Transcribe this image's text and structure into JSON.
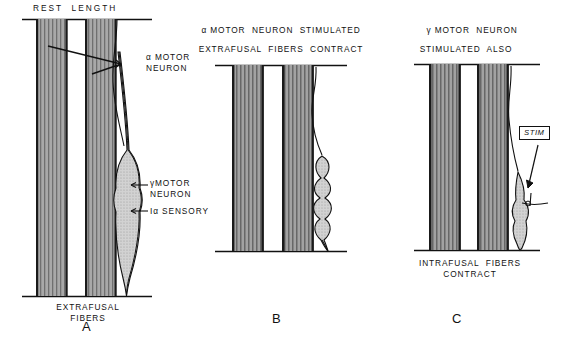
{
  "figure": {
    "type": "anatomical-diagram",
    "panels": [
      {
        "id": "A",
        "letter": "A",
        "header_lines": [
          "REST  LENGTH"
        ],
        "footer_lines": [
          "EXTRAFUSAL",
          "FIBERS"
        ],
        "annotations": [
          {
            "name": "alpha-motor-neuron",
            "text": "α MOTOR\nNEURON"
          },
          {
            "name": "gamma-motor-neuron",
            "text": "γMOTOR\nNEURON"
          },
          {
            "name": "ia-sensory",
            "text": "Iα SENSORY"
          }
        ],
        "state": "spindle at rest length, intrafusal fibers taut"
      },
      {
        "id": "B",
        "letter": "B",
        "header_lines": [
          "α MOTOR  NEURON  STIMULATED",
          "EXTRAFUSAL  FIBERS  CONTRACT"
        ],
        "footer_lines": [],
        "annotations": [],
        "state": "extrafusal fibers shortened, spindle slack and wavy"
      },
      {
        "id": "C",
        "letter": "C",
        "header_lines": [
          "γ MOTOR  NEURON",
          "STIMULATED  ALSO"
        ],
        "footer_lines": [
          "INTRAFUSAL  FIBERS",
          "CONTRACT"
        ],
        "annotations": [
          {
            "name": "stim-box",
            "text": "STIM"
          }
        ],
        "state": "intrafusal fibers contracted, spindle re-tensioned"
      }
    ],
    "colors": {
      "ink": "#111111",
      "fiber_fill": "#9a9a9a",
      "spindle_fill": "#c8c8c8",
      "background": "#ffffff"
    }
  }
}
